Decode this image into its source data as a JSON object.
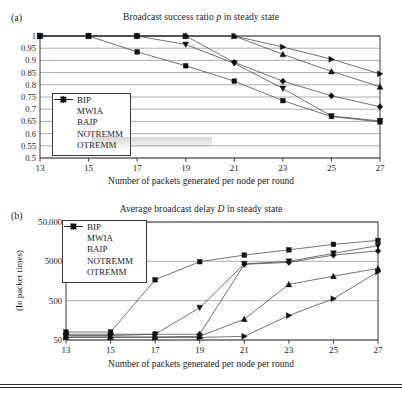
{
  "figure": {
    "panels": [
      {
        "tag": "(a)",
        "title_pre": "Broadcast success ratio ",
        "title_ital": "p",
        "title_post": " in steady state",
        "xlabel": "Number of packets generated per node per round"
      },
      {
        "tag": "(b)",
        "title_pre": "Average broadcast delay ",
        "title_ital": "D",
        "title_post": " in steady state",
        "xlabel": "Number of packets generated per node per round",
        "ylabel": "(In packet times)"
      }
    ]
  },
  "legend": {
    "items": [
      {
        "label": "BIP",
        "marker": "square"
      },
      {
        "label": "MWIA",
        "marker": "diamond"
      },
      {
        "label": "BAIP",
        "marker": "triangle-down"
      },
      {
        "label": "NOTREMM",
        "marker": "triangle-up"
      },
      {
        "label": "OTREMM",
        "marker": "triangle-right"
      }
    ]
  },
  "chart_data": [
    {
      "type": "line",
      "title": "Broadcast success ratio p in steady state",
      "xlabel": "Number of packets generated per node per round",
      "ylabel": "",
      "x": [
        13,
        15,
        17,
        19,
        21,
        23,
        25,
        27
      ],
      "xlim": [
        13,
        27
      ],
      "ylim": [
        0.5,
        1.0
      ],
      "yticks": [
        0.5,
        0.55,
        0.6,
        0.65,
        0.7,
        0.75,
        0.8,
        0.85,
        0.9,
        0.95,
        1
      ],
      "ytick_labels": [
        "0.5",
        "0.55",
        "0.6",
        "0.65",
        "0.7",
        "0.75",
        "0.8",
        "0.85",
        "0.9",
        "0.95",
        "1"
      ],
      "xticks": [
        13,
        15,
        17,
        19,
        21,
        23,
        25,
        27
      ],
      "xtick_labels": [
        "13",
        "15",
        "17",
        "19",
        "21",
        "23",
        "25",
        "27"
      ],
      "grid": true,
      "legend_position": "lower-left",
      "series": [
        {
          "name": "BIP",
          "marker": "square",
          "values": [
            1.0,
            1.0,
            0.935,
            0.878,
            0.815,
            0.735,
            0.67,
            0.648
          ]
        },
        {
          "name": "MWIA",
          "marker": "diamond",
          "values": [
            1.0,
            1.0,
            1.0,
            1.0,
            0.892,
            0.815,
            0.755,
            0.71
          ]
        },
        {
          "name": "BAIP",
          "marker": "triangle-down",
          "values": [
            1.0,
            1.0,
            1.0,
            0.965,
            0.888,
            0.785,
            0.672,
            0.652
          ]
        },
        {
          "name": "NOTREMM",
          "marker": "triangle-up",
          "values": [
            1.0,
            1.0,
            1.0,
            1.0,
            1.0,
            0.925,
            0.855,
            0.792
          ]
        },
        {
          "name": "OTREMM",
          "marker": "triangle-right",
          "values": [
            1.0,
            1.0,
            1.0,
            1.0,
            1.0,
            0.955,
            0.905,
            0.845
          ]
        }
      ]
    },
    {
      "type": "line",
      "title": "Average broadcast delay D in steady state",
      "xlabel": "Number of packets generated per node per round",
      "ylabel": "(In packet times)",
      "x": [
        13,
        15,
        17,
        19,
        21,
        23,
        25,
        27
      ],
      "xlim": [
        13,
        27
      ],
      "yscale": "log",
      "ylim": [
        50,
        50000
      ],
      "yticks": [
        50,
        500,
        5000,
        50000
      ],
      "ytick_labels": [
        "50",
        "500",
        "5000",
        "50,000"
      ],
      "xticks": [
        13,
        15,
        17,
        19,
        21,
        23,
        25,
        27
      ],
      "xtick_labels": [
        "13",
        "15",
        "17",
        "19",
        "21",
        "23",
        "25",
        "27"
      ],
      "grid": true,
      "legend_position": "upper-left",
      "series": [
        {
          "name": "BIP",
          "marker": "square",
          "values": [
            80,
            80,
            1700,
            4900,
            7200,
            9800,
            13500,
            17000
          ]
        },
        {
          "name": "MWIA",
          "marker": "diamond",
          "values": [
            70,
            70,
            70,
            70,
            4200,
            4700,
            7200,
            9200
          ]
        },
        {
          "name": "BAIP",
          "marker": "triangle-down",
          "values": [
            65,
            65,
            70,
            330,
            4300,
            5000,
            8000,
            12500
          ]
        },
        {
          "name": "NOTREMM",
          "marker": "triangle-up",
          "values": [
            60,
            60,
            60,
            62,
            170,
            1300,
            2100,
            3300
          ]
        },
        {
          "name": "OTREMM",
          "marker": "triangle-right",
          "values": [
            58,
            58,
            58,
            58,
            62,
            210,
            560,
            2700
          ]
        }
      ]
    }
  ]
}
